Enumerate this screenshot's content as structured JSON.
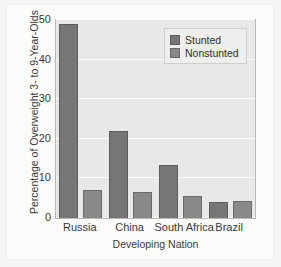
{
  "chart_data": {
    "type": "bar",
    "title": "",
    "xlabel": "Developing Nation",
    "ylabel": "Percentage of Overweight 3- to 9-Year-Olds",
    "categories": [
      "Russia",
      "China",
      "South Africa",
      "Brazil"
    ],
    "series": [
      {
        "name": "Stunted",
        "values": [
          49,
          22,
          13.3,
          4
        ],
        "color": "#777675"
      },
      {
        "name": "Nonstunted",
        "values": [
          7,
          6.5,
          5.5,
          4.3
        ],
        "color": "#8a8988"
      }
    ],
    "ylim": [
      0,
      50
    ],
    "yticks": [
      0,
      10,
      20,
      30,
      40,
      50
    ],
    "ytick_labels": [
      "0",
      "10",
      "20",
      "30",
      "40",
      "50"
    ],
    "grid": "horizontal",
    "legend_position": "top-right-inside",
    "plot_background": "#e9e8e7",
    "gridline_color": "#fbfbfb",
    "frame_color": "#b9b8b7"
  },
  "legend": {
    "items": [
      {
        "label": "Stunted"
      },
      {
        "label": "Nonstunted"
      }
    ]
  },
  "axes": {
    "y_label": "Percentage of Overweight 3- to 9-Year-Olds",
    "x_label": "Developing Nation"
  }
}
